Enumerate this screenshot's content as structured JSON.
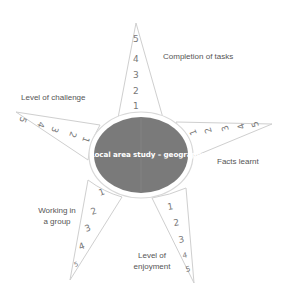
{
  "diagram": {
    "type": "star-rating-diagram",
    "center": {
      "label": "Local area study – geography",
      "fill": "#7a7a7a",
      "ring": "#d8d8d8"
    },
    "colors": {
      "spike_stroke": "#cfcfcf",
      "text": "#555555",
      "numbers": "#777777",
      "background": "#ffffff"
    },
    "spikes": [
      {
        "id": "top",
        "label": "Completion of tasks",
        "scale": [
          "1",
          "2",
          "3",
          "4",
          "5"
        ]
      },
      {
        "id": "upper-left",
        "label": "Level of challenge",
        "scale": [
          "1",
          "2",
          "3",
          "4",
          "5"
        ]
      },
      {
        "id": "upper-right",
        "label": "Facts learnt",
        "scale": [
          "1",
          "2",
          "3",
          "4",
          "5"
        ]
      },
      {
        "id": "lower-left",
        "label_line1": "Working in",
        "label_line2": "a group",
        "scale": [
          "1",
          "2",
          "3",
          "4",
          "5"
        ]
      },
      {
        "id": "lower-right",
        "label_line1": "Level of",
        "label_line2": "enjoyment",
        "scale": [
          "1",
          "2",
          "3",
          "4",
          "5"
        ]
      }
    ]
  }
}
